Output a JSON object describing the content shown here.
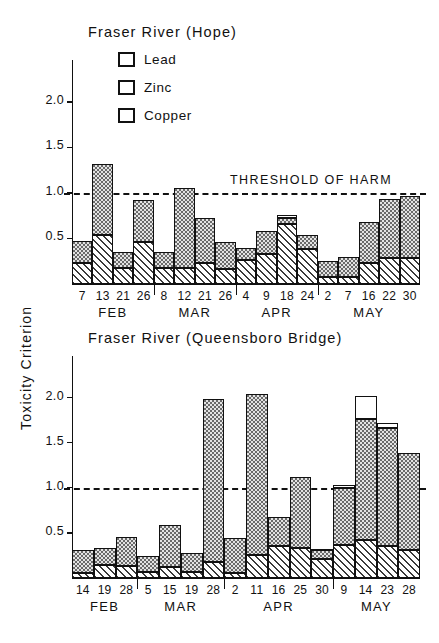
{
  "figure": {
    "y_axis_title": "Toxicity  Criterion",
    "legend": [
      {
        "key": "lead",
        "label": "Lead"
      },
      {
        "key": "zinc",
        "label": "Zinc"
      },
      {
        "key": "copper",
        "label": "Copper"
      }
    ],
    "threshold_label": "THRESHOLD  OF  HARM",
    "threshold_value": 1.0,
    "colors": {
      "line": "#111111",
      "lead_fill": "#ffffff",
      "zinc_fill": "#e3e3e3",
      "copper_fill": "#ffffff"
    }
  },
  "chart_data": [
    {
      "id": "hope",
      "type": "bar",
      "subtype": "stacked",
      "title": "Fraser  River   (Hope)",
      "xlabel": "",
      "ylabel": "Toxicity  Criterion",
      "ylim": [
        0,
        2.35
      ],
      "yticks": [
        0.5,
        1.0,
        1.5,
        2.0
      ],
      "ytick_labels": [
        "0.5",
        "1.0",
        "1.5",
        "2.0"
      ],
      "grid": false,
      "legend_position": "upper-left-inside",
      "annotations": [
        {
          "text": "THRESHOLD  OF  HARM",
          "y": 1.0,
          "type": "dashed-line"
        }
      ],
      "categories": [
        "7",
        "13",
        "21",
        "26",
        "8",
        "12",
        "21",
        "26",
        "4",
        "9",
        "18",
        "24",
        "2",
        "7",
        "16",
        "22",
        "30"
      ],
      "months": [
        {
          "label": "FEB",
          "start": 0,
          "end": 3
        },
        {
          "label": "MAR",
          "start": 4,
          "end": 7
        },
        {
          "label": "APR",
          "start": 8,
          "end": 11
        },
        {
          "label": "MAY",
          "start": 12,
          "end": 16
        }
      ],
      "series": [
        {
          "name": "Copper",
          "values": [
            0.23,
            0.54,
            0.18,
            0.46,
            0.18,
            0.18,
            0.23,
            0.17,
            0.26,
            0.33,
            0.66,
            0.38,
            0.08,
            0.08,
            0.23,
            0.29,
            0.29
          ]
        },
        {
          "name": "Zinc",
          "values": [
            0.24,
            0.78,
            0.17,
            0.46,
            0.17,
            0.87,
            0.49,
            0.29,
            0.14,
            0.25,
            0.07,
            0.16,
            0.17,
            0.22,
            0.45,
            0.64,
            0.68
          ]
        },
        {
          "name": "Lead",
          "values": [
            0.0,
            0.0,
            0.0,
            0.0,
            0.0,
            0.0,
            0.0,
            0.0,
            0.0,
            0.0,
            0.03,
            0.0,
            0.0,
            0.0,
            0.0,
            0.0,
            0.0
          ]
        }
      ],
      "totals": [
        0.47,
        1.32,
        0.35,
        0.92,
        0.35,
        1.05,
        0.72,
        0.46,
        0.4,
        0.58,
        0.76,
        0.54,
        0.25,
        0.3,
        0.68,
        0.93,
        0.97
      ]
    },
    {
      "id": "queensboro",
      "type": "bar",
      "subtype": "stacked",
      "title": "Fraser  River   (Queensboro  Bridge)",
      "xlabel": "",
      "ylabel": "Toxicity  Criterion",
      "ylim": [
        0,
        2.35
      ],
      "yticks": [
        0.5,
        1.0,
        1.5,
        2.0
      ],
      "ytick_labels": [
        "0.5",
        "1.0",
        "1.5",
        "2.0"
      ],
      "grid": false,
      "legend_position": "none",
      "annotations": [
        {
          "text": "",
          "y": 1.0,
          "type": "dashed-line"
        }
      ],
      "categories": [
        "14",
        "19",
        "28",
        "5",
        "15",
        "19",
        "28",
        "2",
        "11",
        "16",
        "25",
        "30",
        "9",
        "14",
        "23",
        "28"
      ],
      "months": [
        {
          "label": "FEB",
          "start": 0,
          "end": 2
        },
        {
          "label": "MAR",
          "start": 3,
          "end": 6
        },
        {
          "label": "APR",
          "start": 7,
          "end": 11
        },
        {
          "label": "MAY",
          "start": 12,
          "end": 15
        }
      ],
      "series": [
        {
          "name": "Copper",
          "values": [
            0.06,
            0.14,
            0.13,
            0.07,
            0.12,
            0.07,
            0.18,
            0.05,
            0.26,
            0.36,
            0.33,
            0.21,
            0.37,
            0.42,
            0.36,
            0.31
          ]
        },
        {
          "name": "Zinc",
          "values": [
            0.25,
            0.19,
            0.33,
            0.17,
            0.47,
            0.21,
            1.8,
            0.39,
            1.78,
            0.32,
            0.79,
            0.1,
            0.63,
            1.34,
            1.3,
            1.08
          ]
        },
        {
          "name": "Lead",
          "values": [
            0.0,
            0.0,
            0.0,
            0.0,
            0.0,
            0.0,
            0.0,
            0.0,
            0.0,
            0.0,
            0.0,
            0.01,
            0.03,
            0.26,
            0.06,
            0.0
          ]
        }
      ],
      "totals": [
        0.31,
        0.33,
        0.46,
        0.24,
        0.59,
        0.28,
        1.98,
        0.44,
        2.04,
        0.68,
        1.12,
        0.32,
        1.03,
        2.02,
        1.72,
        1.39
      ]
    }
  ]
}
